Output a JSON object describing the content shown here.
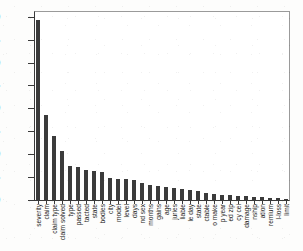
{
  "chart_data": {
    "type": "bar",
    "title": "",
    "subtitle": "",
    "xlabel": "",
    "ylabel": "",
    "ylim": [
      0.0,
      0.4125
    ],
    "grid": false,
    "legend": null,
    "bar_color": "#3b3b3b",
    "axis_color": "#3a3a3a",
    "yticks": [
      0.0,
      0.05,
      0.1,
      0.15,
      0.2,
      0.25,
      0.3,
      0.35,
      0.4
    ],
    "ytick_labels": [
      "0.00",
      "0.05",
      "0.10",
      "0.15",
      "0.20",
      "0.25",
      "0.30",
      "0.35",
      "0.40"
    ],
    "categories": [
      "severity",
      "claim",
      "claim type",
      "claim solved",
      "type",
      "passed",
      "tacted",
      "state",
      "bodies",
      "city",
      "model",
      "level",
      "days",
      "nd sex",
      "months",
      "gains",
      "age",
      "juries",
      "liable",
      "le day",
      "state",
      "ctable",
      "o make",
      "p year",
      "ed zip",
      "cy cei",
      "damage",
      "nship",
      "ation",
      "remium",
      "l-loss",
      "limit"
    ],
    "values": [
      0.392,
      0.186,
      0.139,
      0.106,
      0.074,
      0.071,
      0.066,
      0.063,
      0.062,
      0.049,
      0.046,
      0.045,
      0.044,
      0.038,
      0.033,
      0.031,
      0.029,
      0.027,
      0.024,
      0.022,
      0.019,
      0.016,
      0.013,
      0.011,
      0.01,
      0.009,
      0.008,
      0.007,
      0.006,
      0.005,
      0.004,
      0.003
    ]
  }
}
